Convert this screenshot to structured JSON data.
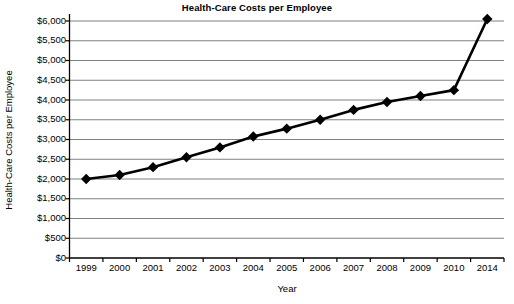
{
  "chart_data": {
    "type": "line",
    "title": "Health-Care Costs per Employee",
    "xlabel": "Year",
    "ylabel": "Health-Care Costs per Employee",
    "categories": [
      "1999",
      "2000",
      "2001",
      "2002",
      "2003",
      "2004",
      "2005",
      "2006",
      "2007",
      "2008",
      "2009",
      "2010",
      "2014"
    ],
    "values": [
      2000,
      2100,
      2300,
      2550,
      2800,
      3075,
      3275,
      3500,
      3750,
      3950,
      4100,
      4250,
      6050
    ],
    "ylim": [
      0,
      6000
    ],
    "ytick_values": [
      6000,
      5500,
      5000,
      4500,
      4000,
      3500,
      3000,
      2500,
      2000,
      1500,
      1000,
      500,
      0
    ],
    "ytick_labels": [
      "$6,000",
      "$5,500",
      "$5,000",
      "$4,500",
      "$4,000",
      "$3,500",
      "$3,000",
      "$2,500",
      "$2,000",
      "$1,500",
      "$1,000",
      "$500",
      "$0"
    ],
    "grid": true,
    "grid_axis": "y",
    "legend": false,
    "marker": "diamond",
    "series_color": "#000000",
    "grid_color": "#808080",
    "axis_color": "#000000"
  },
  "source_note": ""
}
